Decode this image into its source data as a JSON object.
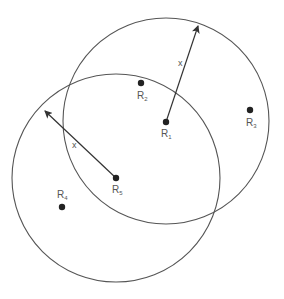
{
  "diagram": {
    "type": "overlapping-circles",
    "stroke_color": "#555555",
    "dot_color": "#222222",
    "circles": [
      {
        "id": "circle-r1",
        "center": "R1",
        "cx": 166,
        "cy": 121,
        "r": 103
      },
      {
        "id": "circle-r5",
        "center": "R5",
        "cx": 116,
        "cy": 178,
        "r": 104
      }
    ],
    "points": [
      {
        "name": "R",
        "sub": "1",
        "x": 166,
        "y": 122
      },
      {
        "name": "R",
        "sub": "2",
        "x": 141,
        "y": 83
      },
      {
        "name": "R",
        "sub": "3",
        "x": 250,
        "y": 110
      },
      {
        "name": "R",
        "sub": "4",
        "x": 62,
        "y": 207
      },
      {
        "name": "R",
        "sub": "5",
        "x": 116,
        "y": 178
      }
    ],
    "radius_label": "x",
    "arrows": [
      {
        "from": "R1",
        "x1": 166,
        "y1": 122,
        "x2": 199,
        "y2": 25,
        "label": "x"
      },
      {
        "from": "R5",
        "x1": 116,
        "y1": 178,
        "x2": 44,
        "y2": 110,
        "label": "x"
      }
    ]
  }
}
